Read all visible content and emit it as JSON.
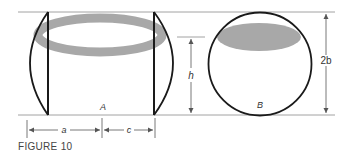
{
  "figure": {
    "caption": "FIGURE 10",
    "labels": {
      "A": "A",
      "B": "B",
      "h": "h",
      "two_b": "2b",
      "a": "a",
      "c": "c"
    },
    "colors": {
      "stroke": "#1a1a1a",
      "guide": "#8a8a8a",
      "shade": "#a8a8a8"
    }
  }
}
